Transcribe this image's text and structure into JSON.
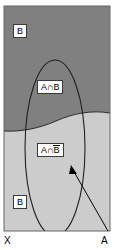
{
  "figure": {
    "type": "venn-set-diagram",
    "title": "",
    "width": 114,
    "height": 250
  },
  "colors": {
    "region_b_fill": "#808080",
    "region_b_complement_fill": "#cccccc",
    "frame_stroke": "#555555",
    "curve_stroke": "#222222",
    "ellipse_stroke": "#222222",
    "arrow_stroke": "#000000",
    "label_box_fill": "#ffffff",
    "label_box_border": "#3a3a3a",
    "text": "#000000"
  },
  "regions": [
    {
      "name": "b-upper",
      "label": "B",
      "overline": false,
      "fill": "#808080",
      "description": "upper dark region inside frame, outside ellipse"
    },
    {
      "name": "a-intersect-b",
      "label": "A∩B",
      "overline": false,
      "fill": "#808080",
      "description": "ellipse portion within dark upper region"
    },
    {
      "name": "a-intersect-b-complement",
      "label": "A∩B",
      "overline": true,
      "overline_part": "B",
      "prefix": "A∩",
      "fill": "#cccccc",
      "description": "ellipse portion within light lower region"
    },
    {
      "name": "b-complement-lower",
      "label": "B",
      "overline": false,
      "fill": "#cccccc",
      "description": "lower light region inside frame, outside ellipse"
    }
  ],
  "labels": {
    "b_top": "B",
    "a_intersect_b": "A∩B",
    "a_intersect_nb_prefix": "A∩",
    "a_intersect_nb_overlined": "B",
    "b_bottom": "B"
  },
  "axes": {
    "x_label": "X",
    "a_label": "A"
  },
  "annotation": {
    "arrow_name": "pointer-to-ellipse-boundary",
    "from_label": "A",
    "points_to": "ellipse boundary (set A)"
  },
  "geometry": {
    "frame": {
      "x": 4,
      "y": 6,
      "width": 106,
      "height": 225
    },
    "ellipse": {
      "cx": 55,
      "cy": 148,
      "rx": 30,
      "ry": 88
    },
    "divider_curve": "gently sloping curve descending left to right across frame"
  }
}
